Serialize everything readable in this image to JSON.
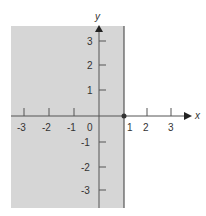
{
  "figure": {
    "shade_color": "#d6d6d6",
    "axis_color": "#555555",
    "x_axis_label": "x",
    "y_axis_label": "y",
    "x_ticks": [
      "-3",
      "-2",
      "-1",
      "0",
      "1",
      "2",
      "3"
    ],
    "y_ticks_pos": [
      "3",
      "2",
      "1"
    ],
    "y_ticks_neg": [
      "-1",
      "-2",
      "-3"
    ],
    "boundary_x": 1,
    "highlight_point": "(1, 0)"
  }
}
